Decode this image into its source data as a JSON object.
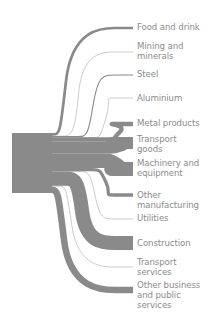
{
  "diagram": {
    "type": "sankey",
    "flow_color": "#8a8a8a",
    "label_color": "#8c8c8c",
    "source": {
      "label": "",
      "x": 12,
      "y_top": 133,
      "y_bottom": 193,
      "width": 38
    },
    "targets": [
      {
        "label": "Food and drink",
        "y": 28,
        "width": 2.5,
        "label_y": 22
      },
      {
        "label": "Mining and\nminerals",
        "y": 52,
        "width": 0.3,
        "label_y": 41
      },
      {
        "label": "Steel",
        "y": 75,
        "width": 1,
        "label_y": 69
      },
      {
        "label": "Aluminium",
        "y": 98,
        "width": 0.2,
        "label_y": 93
      },
      {
        "label": "Metal products",
        "y": 124,
        "width": 4,
        "label_y": 118
      },
      {
        "label": "Transport\ngoods",
        "y": 143,
        "width": 11,
        "label_y": 134
      },
      {
        "label": "Machinery and\nequipment",
        "y": 169,
        "width": 13,
        "label_y": 158
      },
      {
        "label": "Other\nmanufacturing",
        "y": 195,
        "width": 3,
        "label_y": 190
      },
      {
        "label": "Utilities",
        "y": 219,
        "width": 0.4,
        "label_y": 213
      },
      {
        "label": "Construction",
        "y": 243,
        "width": 13,
        "label_y": 238
      },
      {
        "label": "Transport\nservices",
        "y": 267,
        "width": 0.6,
        "label_y": 257
      },
      {
        "label": "Other business\nand public\nservices",
        "y": 290,
        "width": 6,
        "label_y": 280
      }
    ]
  }
}
